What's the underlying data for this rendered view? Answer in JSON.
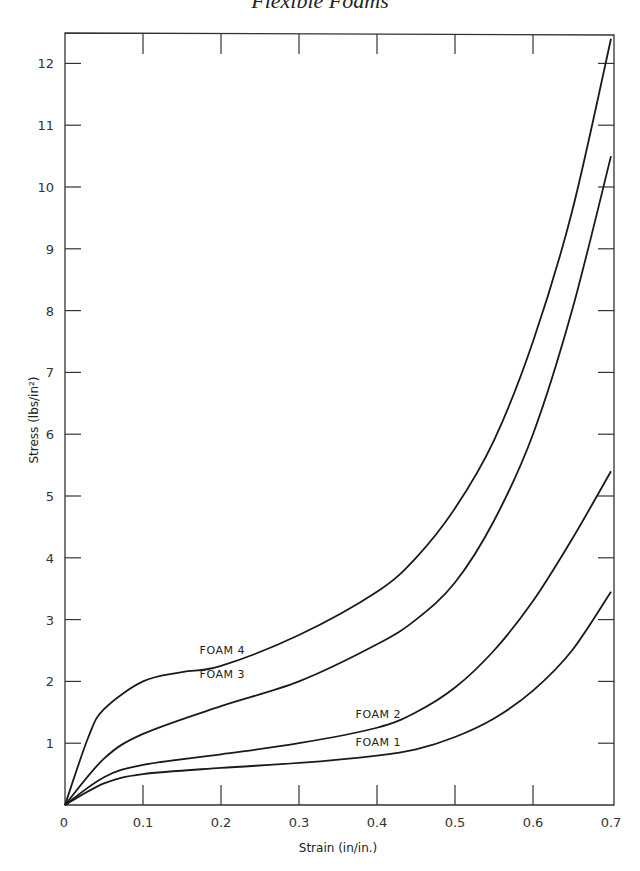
{
  "page": {
    "title": "Flexible Foams"
  },
  "chart_data": {
    "type": "line",
    "title": "Flexible Foams",
    "xlabel": "Strain (in/in.)",
    "ylabel": "Stress (lbs/in²)",
    "xlim": [
      0,
      0.7
    ],
    "ylim": [
      0,
      12.6
    ],
    "xticks": [
      "0",
      "0.1",
      "0.2",
      "0.3",
      "0.4",
      "0.5",
      "0.6",
      "0.7"
    ],
    "yticks": [
      "1",
      "2",
      "3",
      "4",
      "5",
      "6",
      "7",
      "8",
      "9",
      "10",
      "11",
      "12"
    ],
    "grid": false,
    "legend": "inline curve labels",
    "series": [
      {
        "name": "FOAM 1",
        "x": [
          0,
          0.05,
          0.1,
          0.2,
          0.3,
          0.4,
          0.45,
          0.5,
          0.55,
          0.6,
          0.65,
          0.7
        ],
        "y": [
          0,
          0.35,
          0.5,
          0.6,
          0.68,
          0.8,
          0.9,
          1.1,
          1.4,
          1.85,
          2.5,
          3.45
        ]
      },
      {
        "name": "FOAM 2",
        "x": [
          0,
          0.05,
          0.1,
          0.2,
          0.3,
          0.4,
          0.45,
          0.5,
          0.55,
          0.6,
          0.65,
          0.7
        ],
        "y": [
          0,
          0.45,
          0.65,
          0.82,
          1.0,
          1.25,
          1.5,
          1.9,
          2.5,
          3.3,
          4.3,
          5.4
        ]
      },
      {
        "name": "FOAM 3",
        "x": [
          0,
          0.05,
          0.1,
          0.2,
          0.3,
          0.4,
          0.45,
          0.5,
          0.55,
          0.6,
          0.65,
          0.7
        ],
        "y": [
          0,
          0.75,
          1.15,
          1.6,
          2.0,
          2.6,
          3.0,
          3.6,
          4.6,
          6.0,
          8.0,
          10.5
        ]
      },
      {
        "name": "FOAM 4",
        "x": [
          0,
          0.03,
          0.05,
          0.1,
          0.15,
          0.2,
          0.3,
          0.4,
          0.45,
          0.5,
          0.55,
          0.6,
          0.65,
          0.7
        ],
        "y": [
          0,
          1.1,
          1.55,
          2.0,
          2.15,
          2.25,
          2.75,
          3.45,
          4.0,
          4.8,
          5.9,
          7.5,
          9.6,
          12.4
        ]
      }
    ],
    "annotations": [
      {
        "text": "FOAM 4",
        "x": 0.17,
        "y": 2.45
      },
      {
        "text": "FOAM 3",
        "x": 0.17,
        "y": 2.05
      },
      {
        "text": "FOAM 2",
        "x": 0.37,
        "y": 1.4
      },
      {
        "text": "FOAM 1",
        "x": 0.37,
        "y": 0.95
      }
    ]
  }
}
